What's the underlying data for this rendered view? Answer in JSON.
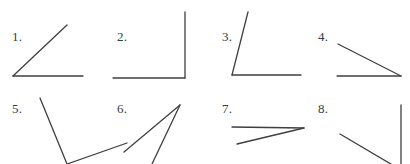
{
  "page": {
    "background_color": "#ffffff",
    "stroke_color": "#3f3f3f",
    "label_color": "#3a3a3a",
    "width": 410,
    "height": 164,
    "grid": {
      "columns": 4,
      "rows": 2
    }
  },
  "figures": [
    {
      "label": "1.",
      "label_x": 12,
      "label_y": 30,
      "vertex": {
        "x": 13,
        "y": 76
      },
      "rays": [
        {
          "name": "horizontal-right-ray",
          "x2": 83,
          "y2": 76
        },
        {
          "name": "up-right-diagonal-ray",
          "x2": 67,
          "y2": 25
        }
      ],
      "angle_degrees": 44,
      "angle_type": "acute"
    },
    {
      "label": "2.",
      "label_x": 117,
      "label_y": 30,
      "vertex": {
        "x": 185,
        "y": 78
      },
      "rays": [
        {
          "name": "horizontal-left-ray",
          "x2": 113,
          "y2": 78
        },
        {
          "name": "vertical-up-ray",
          "x2": 185,
          "y2": 12
        }
      ],
      "angle_degrees": 90,
      "angle_type": "right"
    },
    {
      "label": "3.",
      "label_x": 222,
      "label_y": 30,
      "vertex": {
        "x": 232,
        "y": 75
      },
      "rays": [
        {
          "name": "horizontal-right-ray",
          "x2": 301,
          "y2": 75
        },
        {
          "name": "steep-up-right-ray",
          "x2": 248,
          "y2": 12
        }
      ],
      "angle_degrees": 75,
      "angle_type": "acute"
    },
    {
      "label": "4.",
      "label_x": 318,
      "label_y": 30,
      "vertex": {
        "x": 401,
        "y": 76
      },
      "rays": [
        {
          "name": "horizontal-left-ray",
          "x2": 337,
          "y2": 76
        },
        {
          "name": "shallow-up-left-ray",
          "x2": 338,
          "y2": 44
        }
      ],
      "angle_degrees": 27,
      "angle_type": "acute"
    },
    {
      "label": "5.",
      "label_x": 12,
      "label_y": 102,
      "vertex": {
        "x": 67,
        "y": 164
      },
      "rays": [
        {
          "name": "steep-up-left-ray",
          "x2": 40,
          "y2": 98
        },
        {
          "name": "up-right-diagonal-ray",
          "x2": 127,
          "y2": 143
        }
      ],
      "angle_degrees": 55,
      "angle_type": "acute"
    },
    {
      "label": "6.",
      "label_x": 117,
      "label_y": 102,
      "vertex": {
        "x": 180,
        "y": 105
      },
      "rays": [
        {
          "name": "down-left-shallow-ray",
          "x2": 124,
          "y2": 152
        },
        {
          "name": "down-left-steep-ray",
          "x2": 152,
          "y2": 164
        }
      ],
      "angle_degrees": 22,
      "angle_type": "acute"
    },
    {
      "label": "7.",
      "label_x": 222,
      "label_y": 102,
      "vertex": {
        "x": 304,
        "y": 128
      },
      "rays": [
        {
          "name": "horizontal-left-ray",
          "x2": 232,
          "y2": 127
        },
        {
          "name": "shallow-down-left-ray",
          "x2": 237,
          "y2": 144
        }
      ],
      "angle_degrees": 13,
      "angle_type": "acute"
    },
    {
      "label": "8.",
      "label_x": 318,
      "label_y": 102,
      "vertex": {
        "x": 401,
        "y": 170
      },
      "rays": [
        {
          "name": "vertical-up-ray",
          "x2": 401,
          "y2": 105
        },
        {
          "name": "up-left-diagonal-ray",
          "x2": 340,
          "y2": 134
        }
      ],
      "angle_degrees": 65,
      "angle_type": "acute"
    }
  ]
}
